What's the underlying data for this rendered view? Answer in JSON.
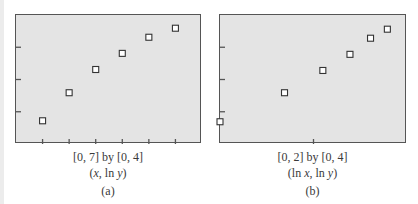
{
  "chart_data": [
    {
      "type": "scatter",
      "panel_label": "(a)",
      "window_label": "[0, 7] by [0, 4]",
      "axes_label": "(x, ln y)",
      "xlabel": "x",
      "ylabel": "ln y",
      "xlim": [
        0,
        7
      ],
      "ylim": [
        0,
        4
      ],
      "xticks": [
        1,
        2,
        3,
        4,
        5,
        6
      ],
      "yticks": [
        1,
        2,
        3
      ],
      "grid": false,
      "marker": "hollow-square",
      "x": [
        1,
        2,
        3,
        4,
        5,
        6
      ],
      "y": [
        0.72,
        1.59,
        2.31,
        2.81,
        3.31,
        3.59
      ]
    },
    {
      "type": "scatter",
      "panel_label": "(b)",
      "window_label": "[0, 2] by [0, 4]",
      "axes_label": "(ln x, ln y)",
      "xlabel": "ln x",
      "ylabel": "ln y",
      "xlim": [
        0,
        2
      ],
      "ylim": [
        0,
        4
      ],
      "xticks": [
        1
      ],
      "yticks": [
        1,
        2,
        3
      ],
      "grid": false,
      "marker": "hollow-square",
      "x": [
        0,
        0.69,
        1.1,
        1.39,
        1.61,
        1.79
      ],
      "y": [
        0.69,
        1.59,
        2.28,
        2.78,
        3.28,
        3.56
      ]
    }
  ],
  "panels": {
    "a": {
      "window": "[0, 7] by [0, 4]",
      "coords_open": "(",
      "coords_x": "x",
      "coords_mid": ", ln ",
      "coords_y": "y",
      "coords_close": ")",
      "label": "(a)"
    },
    "b": {
      "window": "[0, 2] by [0, 4]",
      "coords_open": "(ln ",
      "coords_x": "x",
      "coords_mid": ", ln ",
      "coords_y": "y",
      "coords_close": ")",
      "label": "(b)"
    }
  },
  "colors": {
    "plot_bg": "#e4e4e4",
    "frame": "#555555",
    "marker_stroke": "#333333",
    "marker_fill": "#ffffff"
  }
}
